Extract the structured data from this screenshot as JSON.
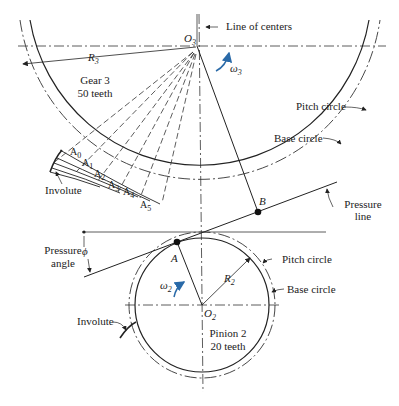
{
  "figure": {
    "gear": {
      "name": "Gear 3",
      "teeth": "50 teeth",
      "center_label": "O",
      "center_sub": "3",
      "radius_label": "R",
      "radius_sub": "3",
      "omega_label": "ω",
      "omega_sub": "3"
    },
    "pinion": {
      "name": "Pinion 2",
      "teeth": "20 teeth",
      "center_label": "O",
      "center_sub": "2",
      "radius_label": "R",
      "radius_sub": "2",
      "omega_label": "ω",
      "omega_sub": "2"
    },
    "labels": {
      "line_of_centers": "Line of centers",
      "pitch_circle_gear": "Pitch circle",
      "base_circle_gear": "Base circle",
      "pressure_line_1": "Pressure",
      "pressure_line_2": "line",
      "pressure_angle_1": "Pressure",
      "pressure_angle_2": "angle",
      "phi": "ϕ",
      "pitch_circle_pinion": "Pitch circle",
      "base_circle_pinion": "Base circle",
      "involute_gear": "Involute",
      "involute_pinion": "Involute",
      "point_A": "A",
      "point_B": "B"
    },
    "involute_points": [
      {
        "label": "A",
        "sub": "0"
      },
      {
        "label": "A",
        "sub": "1"
      },
      {
        "label": "A",
        "sub": "2"
      },
      {
        "label": "A",
        "sub": "3"
      },
      {
        "label": "A",
        "sub": "4"
      },
      {
        "label": "A",
        "sub": "5"
      }
    ],
    "colors": {
      "line": "#222222",
      "accent_arrow": "#2a6aa8"
    }
  }
}
